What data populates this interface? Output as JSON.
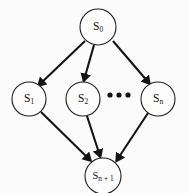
{
  "diagram": {
    "type": "directed-acyclic-graph",
    "background_color": "#fbfbfb",
    "stroke_color": "#141414",
    "node_fill_color": "#fdfdfd",
    "nodes": [
      {
        "id": "s0",
        "base": "S",
        "sub": "0",
        "label": "S0",
        "cx": 98,
        "cy": 27,
        "r": 18
      },
      {
        "id": "s1",
        "base": "S",
        "sub": "1",
        "label": "S1",
        "cx": 29,
        "cy": 99,
        "r": 17
      },
      {
        "id": "s2",
        "base": "S",
        "sub": "2",
        "label": "S2",
        "cx": 83,
        "cy": 99,
        "r": 17
      },
      {
        "id": "sn",
        "base": "S",
        "sub": "n",
        "label": "Sn",
        "cx": 158,
        "cy": 99,
        "r": 17
      },
      {
        "id": "sn1",
        "base": "S",
        "sub": "n + 1",
        "label": "Sn+1",
        "cx": 103,
        "cy": 176,
        "r": 18
      }
    ],
    "ellipsis": {
      "label": "...",
      "dots": [
        {
          "cx": 110,
          "cy": 95,
          "r": 2.6
        },
        {
          "cx": 119,
          "cy": 95,
          "r": 2.6
        },
        {
          "cx": 128,
          "cy": 95,
          "r": 2.6
        }
      ]
    },
    "edges": [
      {
        "id": "e-s0-s1",
        "from": "s0",
        "to": "s1",
        "x1": 85,
        "y1": 41,
        "x2": 39,
        "y2": 85
      },
      {
        "id": "e-s0-s2",
        "from": "s0",
        "to": "s2",
        "x1": 94,
        "y1": 45,
        "x2": 84,
        "y2": 80
      },
      {
        "id": "e-s0-sn",
        "from": "s0",
        "to": "sn",
        "x1": 113,
        "y1": 41,
        "x2": 149,
        "y2": 83
      },
      {
        "id": "e-s1-sn1",
        "from": "s1",
        "to": "sn1",
        "x1": 41,
        "y1": 112,
        "x2": 90,
        "y2": 160
      },
      {
        "id": "e-s2-sn1",
        "from": "s2",
        "to": "sn1",
        "x1": 87,
        "y1": 116,
        "x2": 100,
        "y2": 156
      },
      {
        "id": "e-sn-sn1",
        "from": "sn",
        "to": "sn1",
        "x1": 148,
        "y1": 113,
        "x2": 117,
        "y2": 160
      }
    ]
  }
}
